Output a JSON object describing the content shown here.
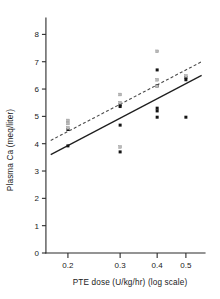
{
  "chart_data": {
    "type": "scatter",
    "title": "",
    "subtitle": "",
    "xlabel": "PTE dose (U/kg/hr) (log scale)",
    "ylabel": "Plasma Ca (meq/liter)",
    "x_scale": "log",
    "y_scale": "linear",
    "xlim": [
      0.17,
      0.58
    ],
    "ylim": [
      0,
      8.6
    ],
    "xticks": [
      0.2,
      0.3,
      0.4,
      0.5
    ],
    "xtick_labels": [
      "0.2",
      "0.3",
      "0.4",
      "0.5"
    ],
    "yticks": [
      0,
      1,
      2,
      3,
      4,
      5,
      6,
      7,
      8
    ],
    "ytick_labels": [
      "0",
      "1",
      "2",
      "3",
      "4",
      "5",
      "6",
      "7",
      "8"
    ],
    "grid": false,
    "legend": "none",
    "marker_colors": {
      "filled": "#141414",
      "open": "#b9b9b9"
    },
    "series": [
      {
        "name": "filled-squares",
        "marker": "filled-square",
        "points": [
          {
            "x": 0.2,
            "y": 3.92
          },
          {
            "x": 0.2,
            "y": 4.52
          },
          {
            "x": 0.3,
            "y": 5.42
          },
          {
            "x": 0.3,
            "y": 5.36
          },
          {
            "x": 0.3,
            "y": 4.68
          },
          {
            "x": 0.3,
            "y": 3.7
          },
          {
            "x": 0.4,
            "y": 6.7
          },
          {
            "x": 0.4,
            "y": 6.12
          },
          {
            "x": 0.4,
            "y": 5.3
          },
          {
            "x": 0.4,
            "y": 5.2
          },
          {
            "x": 0.4,
            "y": 4.97
          },
          {
            "x": 0.5,
            "y": 6.42
          },
          {
            "x": 0.5,
            "y": 6.34
          },
          {
            "x": 0.5,
            "y": 4.97
          }
        ]
      },
      {
        "name": "open-squares",
        "marker": "open-square",
        "points": [
          {
            "x": 0.2,
            "y": 4.85
          },
          {
            "x": 0.2,
            "y": 4.74
          },
          {
            "x": 0.2,
            "y": 4.58
          },
          {
            "x": 0.3,
            "y": 5.8
          },
          {
            "x": 0.3,
            "y": 5.5
          },
          {
            "x": 0.3,
            "y": 3.88
          },
          {
            "x": 0.4,
            "y": 7.38
          },
          {
            "x": 0.4,
            "y": 6.34
          },
          {
            "x": 0.4,
            "y": 6.1
          },
          {
            "x": 0.5,
            "y": 6.48
          }
        ]
      }
    ],
    "fit_lines": [
      {
        "name": "solid-regression-line",
        "style": "solid",
        "x_start": 0.175,
        "y_start": 3.6,
        "x_end": 0.565,
        "y_end": 6.5
      },
      {
        "name": "dashed-regression-line",
        "style": "dashed",
        "x_start": 0.175,
        "y_start": 4.12,
        "x_end": 0.565,
        "y_end": 7.0
      }
    ]
  }
}
